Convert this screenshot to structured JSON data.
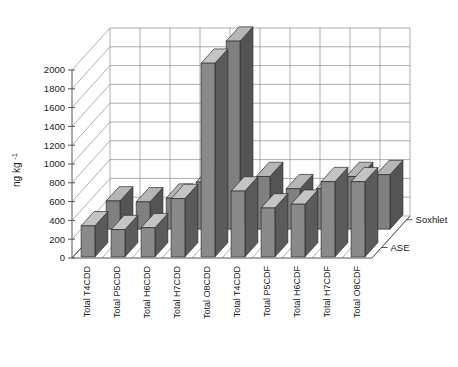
{
  "chart_data": {
    "type": "bar",
    "title": "",
    "xlabel": "",
    "ylabel": "ng kg-1",
    "ylabel_base": "ng kg",
    "ylabel_sup": "-1",
    "ylim": [
      0,
      2000
    ],
    "ytick_step": 200,
    "yticks": [
      "0",
      "200",
      "400",
      "600",
      "800",
      "1000",
      "1200",
      "1400",
      "1600",
      "1800",
      "2000"
    ],
    "grid": true,
    "projection": "3d",
    "legend_position": "right-depth-axis",
    "categories": [
      "Total T4CDD",
      "Total P5CDD",
      "Total H6CDD",
      "Total H7CDD",
      "Total O8CDD",
      "Total T4CDD",
      "Total P5CDF",
      "Total H6CDF",
      "Total H7CDF",
      "Total O8CDF"
    ],
    "series": [
      {
        "name": "ASE",
        "color": "#8a8a8a",
        "values": [
          330,
          290,
          310,
          620,
          2060,
          700,
          520,
          560,
          800,
          800
        ]
      },
      {
        "name": "Soxhlet",
        "color": "#808080",
        "values": [
          300,
          290,
          330,
          500,
          2000,
          560,
          430,
          430,
          560,
          580
        ]
      }
    ]
  },
  "legend": {
    "series_labels": [
      "ASE",
      "Soxhlet"
    ]
  }
}
